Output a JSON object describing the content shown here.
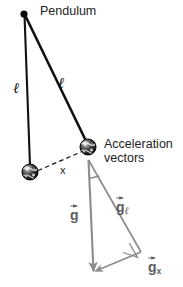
{
  "figure": {
    "title": "Pendulum",
    "width": 183,
    "height": 287,
    "background": "#ffffff"
  },
  "labels": {
    "pendulum": "Pendulum",
    "length_left": "ℓ",
    "length_right": "ℓ",
    "displacement": "x",
    "acceleration_line1": "Acceleration",
    "acceleration_line2": "vectors",
    "vector_g": "g",
    "vector_g_l_base": "g",
    "vector_g_l_sub": "ℓ",
    "vector_g_x_base": "g",
    "vector_g_x_sub": "x"
  },
  "colors": {
    "ink": "#111111",
    "text": "#222222",
    "vector_grey": "#8c8c8c",
    "vector_label_grey": "#5d5d5d",
    "bob_dark": "#111111",
    "bob_light": "#f2f2f2",
    "background": "#ffffff"
  },
  "geometry": {
    "pivot": {
      "x": 24,
      "y": 14
    },
    "bob_rest": {
      "x": 30,
      "y": 172,
      "r": 8
    },
    "bob_swing": {
      "x": 88,
      "y": 147,
      "r": 8
    },
    "rod_left": {
      "x1": 24,
      "y1": 15,
      "x2": 30,
      "y2": 166
    },
    "rod_right": {
      "x1": 25,
      "y1": 15,
      "x2": 86,
      "y2": 141
    },
    "dashed_x": {
      "x1": 38,
      "y1": 170,
      "x2": 82,
      "y2": 152
    },
    "triangle_apex": {
      "x": 88,
      "y": 160
    },
    "triangle_bottom_left": {
      "x": 94,
      "y": 272
    },
    "triangle_bottom_right": {
      "x": 141,
      "y": 252
    },
    "right_angle_marker": {
      "x": 141,
      "y": 252,
      "size": 11
    },
    "apex_tick": {
      "x1": 86,
      "y1": 179,
      "x2": 100,
      "y2": 176
    }
  },
  "vectors": [
    {
      "name": "g",
      "label": "g",
      "subscript": "",
      "from": {
        "x": 88,
        "y": 160
      },
      "to": {
        "x": 94,
        "y": 272
      },
      "description": "gravitational acceleration, straight down"
    },
    {
      "name": "g_l",
      "label": "g",
      "subscript": "ℓ",
      "from": {
        "x": 88,
        "y": 160
      },
      "to": {
        "x": 141,
        "y": 252
      },
      "description": "component along the pendulum rod"
    },
    {
      "name": "g_x",
      "label": "g",
      "subscript": "x",
      "from": {
        "x": 141,
        "y": 252
      },
      "to": {
        "x": 94,
        "y": 272
      },
      "description": "component perpendicular to the rod, restoring direction"
    }
  ]
}
